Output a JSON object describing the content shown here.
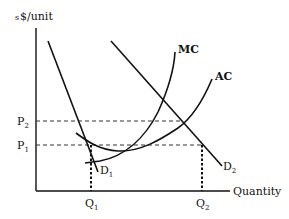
{
  "diagram": {
    "y_axis_label": "$/unit",
    "y_axis_prefix": "s",
    "x_axis_label": "Quantity",
    "price_levels": [
      {
        "id": "P2",
        "base": "P",
        "sub": "2"
      },
      {
        "id": "P1",
        "base": "P",
        "sub": "1"
      }
    ],
    "quantity_levels": [
      {
        "id": "Q1",
        "base": "Q",
        "sub": "1"
      },
      {
        "id": "Q2",
        "base": "Q",
        "sub": "2"
      }
    ],
    "curves": {
      "mc": {
        "label": "MC"
      },
      "ac": {
        "label": "AC"
      },
      "d1": {
        "base": "D",
        "sub": "1"
      },
      "d2": {
        "base": "D",
        "sub": "2"
      }
    }
  }
}
